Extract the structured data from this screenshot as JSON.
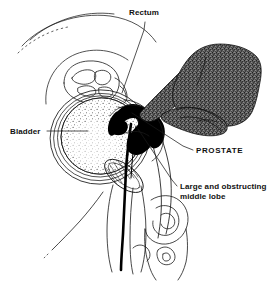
{
  "figure": {
    "kind": "medical-illustration",
    "background_color": "#ffffff",
    "line_color": "#1a1a1a",
    "fill_black": "#000000",
    "stipple_dark_color": "#5a5a5a",
    "stipple_light_color": "#d8d8d8"
  },
  "labels": {
    "rectum": "Rectum",
    "bladder": "Bladder",
    "prostate": "PROSTATE",
    "middle_lobe": "Large and obstructing middle lobe",
    "middle_lobe_line1": "Large and obstructing",
    "middle_lobe_line2": "middle lobe"
  },
  "structures": [
    {
      "name": "abdominal-wall-arcs",
      "style": "thin-outline"
    },
    {
      "name": "sacrum-vertebrae",
      "style": "thin-outline"
    },
    {
      "name": "bladder",
      "style": "oval-with-light-stipple-and-concentric-walls"
    },
    {
      "name": "seminal-vesicle",
      "style": "hatched-ellipse"
    },
    {
      "name": "prostate-middle-lobe",
      "style": "solid-black"
    },
    {
      "name": "urethra",
      "style": "solid-black-curve"
    },
    {
      "name": "rectum",
      "style": "thin-outline"
    },
    {
      "name": "examining-gloved-hand",
      "style": "dark-stipple-mass"
    },
    {
      "name": "penis-scrotum",
      "style": "thin-outline"
    }
  ],
  "leader_lines": [
    {
      "name": "rectum-leader",
      "from": [
        145,
        22
      ],
      "to": [
        120,
        90
      ]
    },
    {
      "name": "bladder-leader",
      "from": [
        47,
        131
      ],
      "to": [
        88,
        131
      ]
    },
    {
      "name": "prostate-leader",
      "from": [
        193,
        150
      ],
      "to": [
        131,
        112
      ]
    },
    {
      "name": "lobe-leader",
      "from": [
        177,
        186
      ],
      "to": [
        137,
        128
      ]
    }
  ]
}
